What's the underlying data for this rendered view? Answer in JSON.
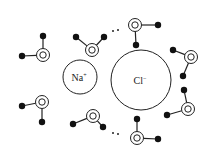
{
  "diagram": {
    "colors": {
      "stroke": "#222222",
      "fill_atom": "#111111",
      "background": "#ffffff"
    },
    "ions": [
      {
        "id": "sodium",
        "label": "Na",
        "charge": "+",
        "cx": 80,
        "cy": 77,
        "r": 17
      },
      {
        "id": "chloride",
        "label": "Cl",
        "charge": "−",
        "cx": 141,
        "cy": 80,
        "r": 30
      }
    ],
    "water_molecules": [
      {
        "o": [
          43,
          55
        ],
        "h": [
          [
            43,
            36
          ],
          [
            22,
            56
          ]
        ]
      },
      {
        "o": [
          92,
          50
        ],
        "h": [
          [
            76,
            37
          ],
          [
            104,
            37
          ]
        ]
      },
      {
        "o": [
          135,
          25
        ],
        "h": [
          [
            158,
            25
          ],
          [
            136,
            45
          ]
        ]
      },
      {
        "o": [
          191,
          57
        ],
        "h": [
          [
            173,
            50
          ],
          [
            183,
            76
          ]
        ]
      },
      {
        "o": [
          188,
          109
        ],
        "h": [
          [
            184,
            90
          ],
          [
            167,
            115
          ]
        ]
      },
      {
        "o": [
          137,
          138
        ],
        "h": [
          [
            137,
            119
          ],
          [
            158,
            139
          ]
        ]
      },
      {
        "o": [
          93,
          116
        ],
        "h": [
          [
            73,
            124
          ],
          [
            103,
            127
          ]
        ]
      },
      {
        "o": [
          42,
          102
        ],
        "h": [
          [
            22,
            106
          ],
          [
            42,
            122
          ]
        ]
      }
    ],
    "hydrogen_bonds": [
      {
        "dots": [
          [
            113,
            31
          ],
          [
            118,
            30
          ]
        ]
      },
      {
        "dots": [
          [
            113,
            133
          ],
          [
            118,
            134
          ]
        ]
      }
    ]
  }
}
